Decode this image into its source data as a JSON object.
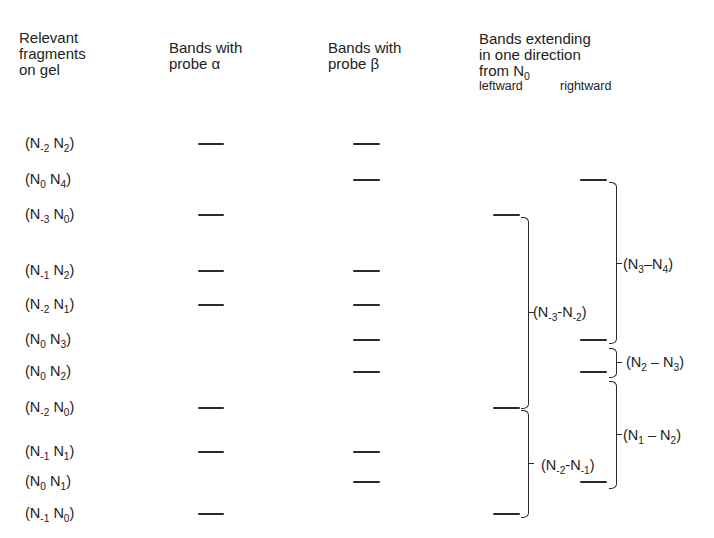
{
  "headers": {
    "fragments": [
      "Relevant",
      "fragments",
      "on gel"
    ],
    "probe_alpha": [
      "Bands with",
      "probe α"
    ],
    "probe_beta": [
      "Bands with",
      "probe β"
    ],
    "extending": [
      "Bands extending",
      "in one direction",
      "from N"
    ],
    "extending_subscript": "0",
    "leftward": "leftward",
    "rightward": "rightward"
  },
  "rows": [
    {
      "a": "N",
      "a_sub": "-2",
      "b": "N",
      "b_sub": "2",
      "alpha": true,
      "beta": true,
      "leftward": false,
      "rightward": false
    },
    {
      "a": "N",
      "a_sub": "0",
      "b": "N",
      "b_sub": "4",
      "alpha": false,
      "beta": true,
      "leftward": false,
      "rightward": true
    },
    {
      "a": "N",
      "a_sub": "-3",
      "b": "N",
      "b_sub": "0",
      "alpha": true,
      "beta": false,
      "leftward": true,
      "rightward": false
    },
    {
      "a": "N",
      "a_sub": "-1",
      "b": "N",
      "b_sub": "2",
      "alpha": true,
      "beta": true,
      "leftward": false,
      "rightward": false
    },
    {
      "a": "N",
      "a_sub": "-2",
      "b": "N",
      "b_sub": "1",
      "alpha": true,
      "beta": true,
      "leftward": false,
      "rightward": false
    },
    {
      "a": "N",
      "a_sub": "0",
      "b": "N",
      "b_sub": "3",
      "alpha": false,
      "beta": true,
      "leftward": false,
      "rightward": true
    },
    {
      "a": "N",
      "a_sub": "0",
      "b": "N",
      "b_sub": "2",
      "alpha": false,
      "beta": true,
      "leftward": false,
      "rightward": true
    },
    {
      "a": "N",
      "a_sub": "-2",
      "b": "N",
      "b_sub": "0",
      "alpha": true,
      "beta": false,
      "leftward": true,
      "rightward": false
    },
    {
      "a": "N",
      "a_sub": "-1",
      "b": "N",
      "b_sub": "1",
      "alpha": true,
      "beta": true,
      "leftward": false,
      "rightward": false
    },
    {
      "a": "N",
      "a_sub": "0",
      "b": "N",
      "b_sub": "1",
      "alpha": false,
      "beta": true,
      "leftward": false,
      "rightward": true
    },
    {
      "a": "N",
      "a_sub": "-1",
      "b": "N",
      "b_sub": "0",
      "alpha": true,
      "beta": false,
      "leftward": true,
      "rightward": false
    }
  ],
  "brackets": {
    "leftward": [
      {
        "from": "N",
        "from_sub": "-3",
        "sep": "-",
        "to": "N",
        "to_sub": "-2"
      },
      {
        "from": "N",
        "from_sub": "-2",
        "sep": "-",
        "to": "N",
        "to_sub": "-1"
      }
    ],
    "rightward": [
      {
        "from": "N",
        "from_sub": "3",
        "sep": "–",
        "to": "N",
        "to_sub": "4"
      },
      {
        "from": "N",
        "from_sub": "2",
        "sep": " – ",
        "to": "N",
        "to_sub": "3"
      },
      {
        "from": "N",
        "from_sub": "1",
        "sep": " – ",
        "to": "N",
        "to_sub": "2"
      }
    ]
  },
  "colors": {
    "ink": "#2a2a2a",
    "background": "#ffffff"
  }
}
